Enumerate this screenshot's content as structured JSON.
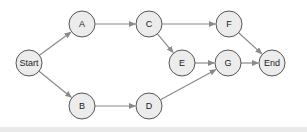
{
  "diagram": {
    "type": "directed-graph",
    "nodes": [
      {
        "id": "start",
        "label": "Start",
        "x": 29,
        "y": 63
      },
      {
        "id": "a",
        "label": "A",
        "x": 82,
        "y": 24
      },
      {
        "id": "c",
        "label": "C",
        "x": 149,
        "y": 24
      },
      {
        "id": "f",
        "label": "F",
        "x": 229,
        "y": 24
      },
      {
        "id": "e",
        "label": "E",
        "x": 182,
        "y": 63
      },
      {
        "id": "g",
        "label": "G",
        "x": 228,
        "y": 63
      },
      {
        "id": "end",
        "label": "End",
        "x": 272,
        "y": 63
      },
      {
        "id": "b",
        "label": "B",
        "x": 82,
        "y": 106
      },
      {
        "id": "d",
        "label": "D",
        "x": 149,
        "y": 106
      }
    ],
    "edges": [
      {
        "from": "start",
        "to": "a"
      },
      {
        "from": "start",
        "to": "b"
      },
      {
        "from": "a",
        "to": "c"
      },
      {
        "from": "b",
        "to": "d"
      },
      {
        "from": "c",
        "to": "f"
      },
      {
        "from": "c",
        "to": "e"
      },
      {
        "from": "e",
        "to": "g"
      },
      {
        "from": "d",
        "to": "g"
      },
      {
        "from": "f",
        "to": "end"
      },
      {
        "from": "g",
        "to": "end"
      }
    ],
    "colors": {
      "node_fill": "#ececec",
      "node_stroke": "#555555",
      "edge": "#8a8a8a"
    }
  }
}
